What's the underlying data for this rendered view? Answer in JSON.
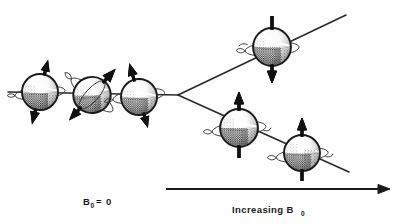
{
  "figure": {
    "background_color": "#fefefe",
    "ink_color": "#1a1a1a",
    "labels": {
      "zero_field": {
        "symbol": "B",
        "subscript": "0",
        "relation": "=",
        "value": "0",
        "full_text": "B0 = 0"
      },
      "increasing_field": {
        "text": "Increasing B",
        "subscript": "0",
        "full_text": "Increasing B0"
      }
    },
    "axis": {
      "name": "increasing-b0-axis",
      "direction": "right",
      "x_start": 166,
      "x_end": 390,
      "y": 189
    },
    "energy_levels": [
      {
        "name": "degenerate-level",
        "type": "horizontal",
        "label": "degenerate spin states at zero field",
        "x1": 8,
        "y1": 92,
        "x2": 178,
        "y2": 95
      },
      {
        "name": "upper-level-spin-down",
        "type": "diverging-up",
        "label": "higher energy, spin anti-parallel (m = -1/2)",
        "x1": 178,
        "y1": 95,
        "x2": 346,
        "y2": 15
      },
      {
        "name": "lower-level-spin-up",
        "type": "diverging-down",
        "label": "lower energy, spin parallel (m = +1/2)",
        "x1": 178,
        "y1": 95,
        "x2": 349,
        "y2": 172
      }
    ],
    "spins": [
      {
        "name": "spin-random-1",
        "group": "zero-field",
        "cx": 40,
        "cy": 92,
        "r": 18,
        "arrow_angle_deg": 14,
        "arrow_direction": "double",
        "arrow_head": "down",
        "ring_tilt_deg": -6,
        "label": "randomly oriented precessing spin 1"
      },
      {
        "name": "spin-random-2",
        "group": "zero-field",
        "cx": 92,
        "cy": 95,
        "r": 19,
        "arrow_angle_deg": 42,
        "arrow_direction": "double",
        "arrow_head": "up-left",
        "ring_tilt_deg": 38,
        "label": "randomly oriented precessing spin 2"
      },
      {
        "name": "spin-random-3",
        "group": "zero-field",
        "cx": 139,
        "cy": 97,
        "r": 18,
        "arrow_angle_deg": -16,
        "arrow_direction": "double",
        "arrow_head": "up",
        "ring_tilt_deg": -8,
        "label": "randomly oriented precessing spin 3"
      },
      {
        "name": "spin-aligned-down-upper",
        "group": "upper-level",
        "cx": 272,
        "cy": 47,
        "r": 19,
        "arrow_angle_deg": 0,
        "arrow_direction": "down",
        "arrow_head": "down",
        "ring_tilt_deg": -4,
        "label": "anti-parallel spin on upper energy level"
      },
      {
        "name": "spin-aligned-up-lower-1",
        "group": "lower-level",
        "cx": 239,
        "cy": 128,
        "r": 19,
        "arrow_angle_deg": 0,
        "arrow_direction": "up",
        "arrow_head": "up",
        "ring_tilt_deg": -6,
        "label": "parallel spin on lower energy level, first"
      },
      {
        "name": "spin-aligned-up-lower-2",
        "group": "lower-level",
        "cx": 302,
        "cy": 153,
        "r": 18,
        "arrow_angle_deg": 0,
        "arrow_direction": "up",
        "arrow_head": "up",
        "ring_tilt_deg": -6,
        "label": "parallel spin on lower energy level, second"
      }
    ]
  }
}
